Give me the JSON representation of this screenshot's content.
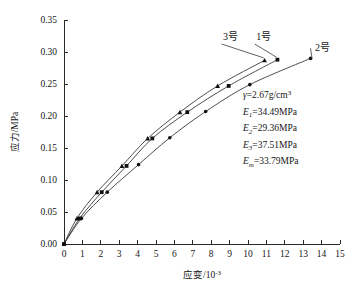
{
  "chart_data": {
    "type": "line",
    "title": "",
    "xlabel": "应变/10⁻³",
    "ylabel": "应力/MPa",
    "xlim": [
      0,
      15
    ],
    "ylim": [
      0,
      0.35
    ],
    "xticks": [
      "0",
      "1",
      "2",
      "3",
      "4",
      "5",
      "6",
      "7",
      "8",
      "9",
      "10",
      "11",
      "12",
      "13",
      "14",
      "15"
    ],
    "yticks": [
      "0.00",
      "0.05",
      "0.10",
      "0.15",
      "0.20",
      "0.25",
      "0.30",
      "0.35"
    ],
    "grid": false,
    "legend_position": "inline-curve-labels",
    "series": [
      {
        "name": "3号",
        "marker": "triangle",
        "label_x": 9.05,
        "label_y": 0.318,
        "points": [
          {
            "x": 0.0,
            "y": 0.0
          },
          {
            "x": 0.7,
            "y": 0.04
          },
          {
            "x": 1.8,
            "y": 0.081
          },
          {
            "x": 3.15,
            "y": 0.122
          },
          {
            "x": 4.55,
            "y": 0.165
          },
          {
            "x": 6.3,
            "y": 0.206
          },
          {
            "x": 8.35,
            "y": 0.247
          },
          {
            "x": 10.9,
            "y": 0.287
          }
        ]
      },
      {
        "name": "1号",
        "marker": "square",
        "label_x": 10.85,
        "label_y": 0.318,
        "points": [
          {
            "x": 0.0,
            "y": 0.0
          },
          {
            "x": 0.85,
            "y": 0.04
          },
          {
            "x": 2.05,
            "y": 0.081
          },
          {
            "x": 3.4,
            "y": 0.122
          },
          {
            "x": 4.8,
            "y": 0.165
          },
          {
            "x": 6.7,
            "y": 0.206
          },
          {
            "x": 8.95,
            "y": 0.247
          },
          {
            "x": 11.6,
            "y": 0.288
          }
        ]
      },
      {
        "name": "2号",
        "marker": "dot",
        "label_x": 14.05,
        "label_y": 0.302,
        "points": [
          {
            "x": 0.0,
            "y": 0.0
          },
          {
            "x": 0.95,
            "y": 0.04
          },
          {
            "x": 2.35,
            "y": 0.081
          },
          {
            "x": 4.05,
            "y": 0.124
          },
          {
            "x": 5.75,
            "y": 0.166
          },
          {
            "x": 7.7,
            "y": 0.207
          },
          {
            "x": 10.1,
            "y": 0.249
          },
          {
            "x": 13.4,
            "y": 0.29
          }
        ]
      }
    ],
    "annotations": [
      {
        "id": "gamma",
        "symbol": "γ",
        "sub": "",
        "eq": "=2.67g/cm",
        "sup": "3"
      },
      {
        "id": "E1",
        "symbol": "E",
        "sub": "1",
        "eq": "=34.49MPa",
        "sup": ""
      },
      {
        "id": "E2",
        "symbol": "E",
        "sub": "2",
        "eq": "=29.36MPa",
        "sup": ""
      },
      {
        "id": "E3",
        "symbol": "E",
        "sub": "3",
        "eq": "=37.51MPa",
        "sup": ""
      },
      {
        "id": "Em",
        "symbol": "E",
        "sub": "m",
        "eq": "=33.79MPa",
        "sup": ""
      }
    ],
    "axis_label_parts": {
      "x_main": "应变/10",
      "x_exp": "-3",
      "y_main": "应力/MPa"
    }
  }
}
